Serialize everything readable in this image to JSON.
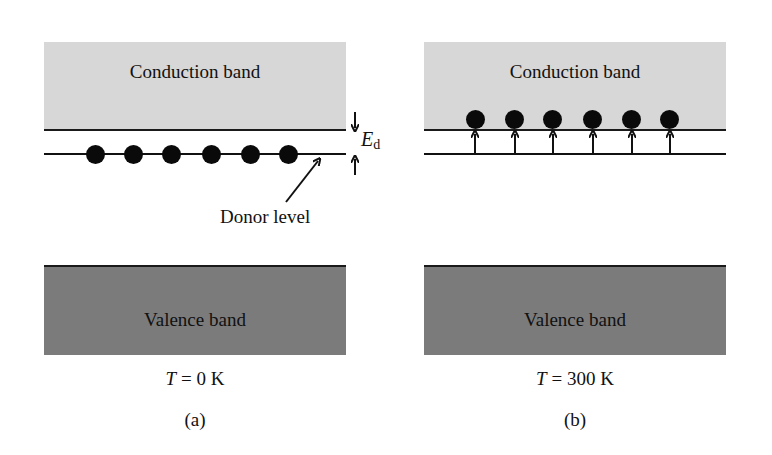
{
  "figure": {
    "panels": [
      {
        "id": "a",
        "conduction_label": "Conduction band",
        "valence_label": "Valence band",
        "temperature_var": "T",
        "temperature_value": " = 0 K",
        "caption": "(a)",
        "electrons_at": "donor level",
        "electron_count": 6
      },
      {
        "id": "b",
        "conduction_label": "Conduction band",
        "valence_label": "Valence band",
        "temperature_var": "T",
        "temperature_value": " = 300 K",
        "caption": "(b)",
        "electrons_at": "conduction band edge",
        "electron_count": 6
      }
    ],
    "annotations": {
      "energy_gap_symbol": "E",
      "energy_gap_subscript": "d",
      "donor_level_label": "Donor level"
    },
    "colors": {
      "conduction_band": "#d7d7d7",
      "valence_band": "#7b7b7b",
      "lines": "#111111",
      "electrons": "#0a0a0a"
    }
  }
}
